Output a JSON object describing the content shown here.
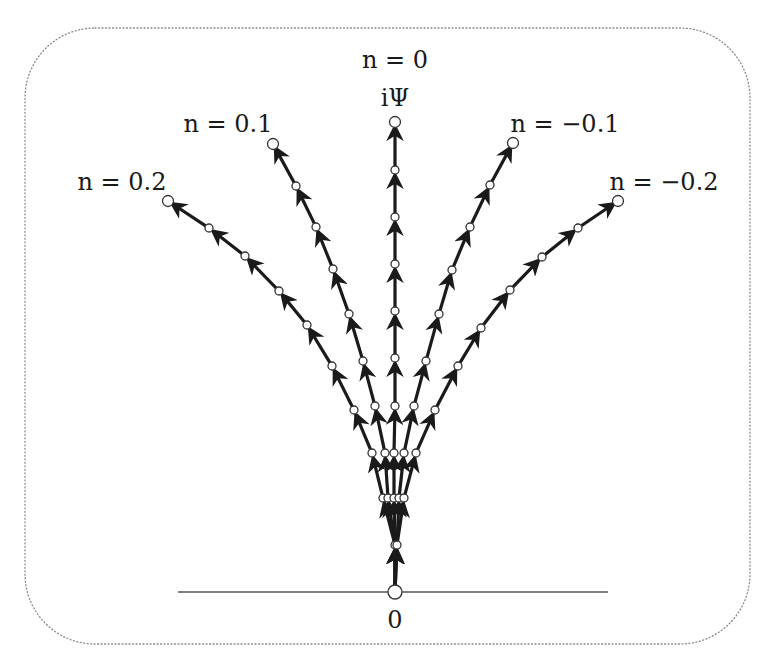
{
  "diagram": {
    "frame": {
      "x": 25,
      "y": 28,
      "width": 725,
      "height": 616,
      "radius": 70,
      "style": "dotted",
      "color": "#8a8a8a"
    },
    "baseline": {
      "x1": 178,
      "x2": 608,
      "y": 592,
      "color": "#555555"
    },
    "origin": {
      "x": 395,
      "y": 592,
      "label": "0",
      "label_x": 395,
      "label_y": 628
    },
    "top_label": {
      "text": "iΨ",
      "x": 395,
      "y": 106
    },
    "colors": {
      "path": "#1a1a1a",
      "node_fill": "#ffffff",
      "node_stroke": "#333333"
    },
    "paths": [
      {
        "name": "n = 0.2",
        "label": "n = 0.2",
        "label_x": 122,
        "label_y": 190,
        "nodes": [
          [
            395,
            592
          ],
          [
            395,
            545
          ],
          [
            383,
            498
          ],
          [
            372,
            453
          ],
          [
            354,
            410
          ],
          [
            332,
            366
          ],
          [
            307,
            325
          ],
          [
            279,
            291
          ],
          [
            245,
            256
          ],
          [
            209,
            228
          ],
          [
            168,
            201
          ]
        ]
      },
      {
        "name": "n = 0.1",
        "label": "n = 0.1",
        "label_x": 228,
        "label_y": 132,
        "nodes": [
          [
            395,
            592
          ],
          [
            395,
            545
          ],
          [
            388,
            498
          ],
          [
            385,
            453
          ],
          [
            375,
            406
          ],
          [
            363,
            361
          ],
          [
            349,
            314
          ],
          [
            333,
            269
          ],
          [
            316,
            227
          ],
          [
            296,
            186
          ],
          [
            273,
            144
          ]
        ]
      },
      {
        "name": "n = 0",
        "label": "n = 0",
        "label_x": 395,
        "label_y": 68,
        "nodes": [
          [
            395,
            592
          ],
          [
            395,
            545
          ],
          [
            394,
            498
          ],
          [
            394,
            453
          ],
          [
            395,
            406
          ],
          [
            395,
            358
          ],
          [
            395,
            311
          ],
          [
            395,
            264
          ],
          [
            395,
            217
          ],
          [
            395,
            170
          ],
          [
            395,
            122
          ]
        ]
      },
      {
        "name": "n = -0.1",
        "label": "n = −0.1",
        "label_x": 565,
        "label_y": 132,
        "nodes": [
          [
            395,
            592
          ],
          [
            397,
            545
          ],
          [
            399,
            498
          ],
          [
            404,
            453
          ],
          [
            414,
            406
          ],
          [
            426,
            361
          ],
          [
            439,
            314
          ],
          [
            452,
            270
          ],
          [
            470,
            227
          ],
          [
            490,
            185
          ],
          [
            513,
            143
          ]
        ]
      },
      {
        "name": "n = -0.2",
        "label": "n = −0.2",
        "label_x": 664,
        "label_y": 190,
        "nodes": [
          [
            395,
            592
          ],
          [
            397,
            545
          ],
          [
            404,
            498
          ],
          [
            416,
            453
          ],
          [
            435,
            410
          ],
          [
            458,
            366
          ],
          [
            481,
            328
          ],
          [
            510,
            290
          ],
          [
            542,
            257
          ],
          [
            578,
            228
          ],
          [
            618,
            201
          ]
        ]
      }
    ]
  }
}
